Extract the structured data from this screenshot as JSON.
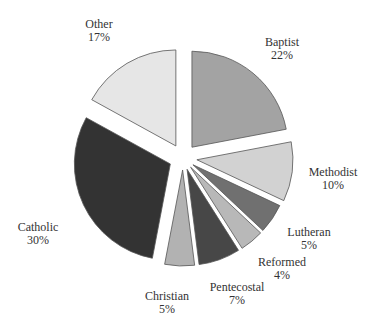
{
  "chart_data": {
    "type": "pie",
    "title": "",
    "exploded": true,
    "start_angle_deg": 0,
    "direction": "clockwise",
    "categories": [
      "Baptist",
      "Methodist",
      "Lutheran",
      "Reformed",
      "Pentecostal",
      "Christian",
      "Catholic",
      "Other"
    ],
    "values": [
      22,
      10,
      5,
      4,
      7,
      5,
      30,
      17
    ],
    "labels": [
      "22%",
      "10%",
      "5%",
      "4%",
      "7%",
      "5%",
      "30%",
      "17%"
    ],
    "colors": [
      "#a3a3a3",
      "#d2d2d2",
      "#707070",
      "#b8b8b8",
      "#474747",
      "#b2b2b2",
      "#333333",
      "#e6e6e6"
    ],
    "legend": "none (labels placed beside slices)"
  },
  "geometry": {
    "cx": 183,
    "cy": 158,
    "r": 96,
    "explode": [
      14,
      14,
      12,
      12,
      12,
      12,
      14,
      14
    ]
  },
  "label_positions": [
    {
      "x": 282,
      "y": 46
    },
    {
      "x": 333,
      "y": 176
    },
    {
      "x": 309,
      "y": 236
    },
    {
      "x": 282,
      "y": 266
    },
    {
      "x": 237,
      "y": 291
    },
    {
      "x": 167,
      "y": 300
    },
    {
      "x": 38,
      "y": 231
    },
    {
      "x": 99,
      "y": 28
    }
  ]
}
